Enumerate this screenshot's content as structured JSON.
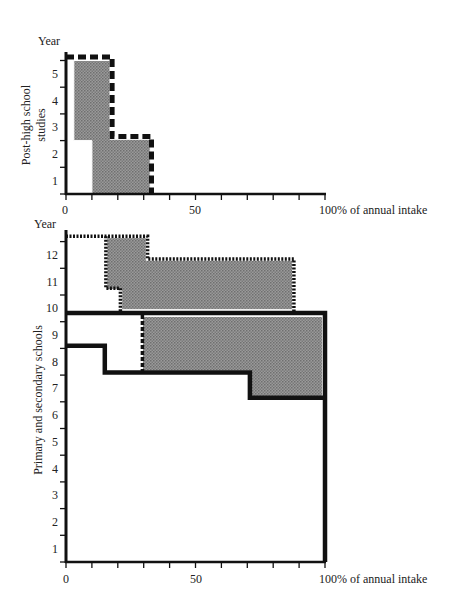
{
  "chart_data": [
    {
      "type": "area",
      "panel": "top",
      "title": "",
      "ylabel": "Post-high school studies",
      "ylabel_lines": [
        "Post-high school",
        "studies"
      ],
      "y_axis_title": "Year",
      "xlabel": "100% of annual intake",
      "x_tick_labels": [
        "0",
        "50",
        "100% of annual intake"
      ],
      "x_ticks": [
        0,
        10,
        20,
        30,
        40,
        50,
        60,
        70,
        80,
        90,
        100
      ],
      "y_tick_labels": [
        "1",
        "2",
        "3",
        "4",
        "5"
      ],
      "xlim": [
        0,
        100
      ],
      "ylim": [
        0,
        5.2
      ],
      "grid": false,
      "series": [
        {
          "name": "Enrolment envelope (dashed)",
          "style": "dashed-thick",
          "points": [
            [
              0,
              5.13
            ],
            [
              17.8,
              5.13
            ],
            [
              17.8,
              2.15
            ],
            [
              33,
              2.15
            ],
            [
              33,
              0
            ]
          ]
        },
        {
          "name": "Shaded enrolment",
          "style": "shaded",
          "points": [
            [
              3,
              5.0
            ],
            [
              17,
              5.0
            ],
            [
              17,
              2.05
            ],
            [
              32.5,
              2.05
            ],
            [
              32.5,
              0
            ],
            [
              10,
              0
            ],
            [
              10,
              2.0
            ],
            [
              3,
              2.0
            ]
          ]
        }
      ]
    },
    {
      "type": "area",
      "panel": "bottom",
      "title": "",
      "ylabel": "Primary and secondary schools",
      "y_axis_title": "Year",
      "xlabel": "100% of annual intake",
      "x_tick_labels": [
        "0",
        "50",
        "100% of annual intake"
      ],
      "x_ticks": [
        0,
        10,
        20,
        30,
        40,
        50,
        60,
        70,
        80,
        90,
        100
      ],
      "y_tick_labels": [
        "1",
        "2",
        "3",
        "4",
        "5",
        "6",
        "7",
        "8",
        "9",
        "10",
        "11",
        "12"
      ],
      "xlim": [
        0,
        100
      ],
      "ylim": [
        0,
        12.3
      ],
      "grid": false,
      "series": [
        {
          "name": "Upper secondary envelope (dotted)",
          "style": "dotted",
          "points": [
            [
              0,
              12.2
            ],
            [
              31.5,
              12.2
            ],
            [
              31.5,
              11.35
            ],
            [
              88,
              11.35
            ],
            [
              88,
              9.35
            ]
          ]
        },
        {
          "name": "Upper secondary left boundary (dotted)",
          "style": "dotted",
          "points": [
            [
              15.4,
              12.2
            ],
            [
              15.4,
              10.25
            ],
            [
              21,
              10.25
            ],
            [
              21,
              9.4
            ]
          ]
        },
        {
          "name": "Upper secondary shaded",
          "style": "shaded",
          "points": [
            [
              15.8,
              12.15
            ],
            [
              31,
              12.15
            ],
            [
              31,
              11.3
            ],
            [
              87.5,
              11.3
            ],
            [
              87.5,
              9.45
            ],
            [
              21.5,
              9.45
            ],
            [
              21.5,
              10.2
            ],
            [
              15.8,
              10.2
            ]
          ]
        },
        {
          "name": "Compulsory school envelope (solid)",
          "style": "solid-thick",
          "points": [
            [
              0,
              9.33
            ],
            [
              100,
              9.33
            ],
            [
              100,
              0
            ]
          ]
        },
        {
          "name": "Compulsory school completion line (solid)",
          "style": "solid-thick",
          "points": [
            [
              0,
              8.1
            ],
            [
              15,
              8.1
            ],
            [
              15,
              7.1
            ],
            [
              71,
              7.1
            ],
            [
              71,
              6.15
            ],
            [
              100,
              6.15
            ]
          ]
        },
        {
          "name": "Lower secondary shaded",
          "style": "shaded",
          "points": [
            [
              29.5,
              9.2
            ],
            [
              99,
              9.2
            ],
            [
              99,
              6.2
            ],
            [
              71.5,
              6.2
            ],
            [
              71.5,
              7.15
            ],
            [
              29.5,
              7.15
            ]
          ]
        },
        {
          "name": "Lower secondary left boundary (dashed)",
          "style": "dashed-thin",
          "points": [
            [
              29.5,
              9.25
            ],
            [
              29.5,
              7.1
            ]
          ]
        }
      ]
    }
  ],
  "labels": {
    "top_year": "Year",
    "bottom_year": "Year",
    "top_ylabel_line1": "Post-high school",
    "top_ylabel_line2": "studies",
    "bottom_ylabel": "Primary and secondary schools",
    "x_zero": "0",
    "x_fifty": "50",
    "x_hundred": "100% of annual intake"
  }
}
